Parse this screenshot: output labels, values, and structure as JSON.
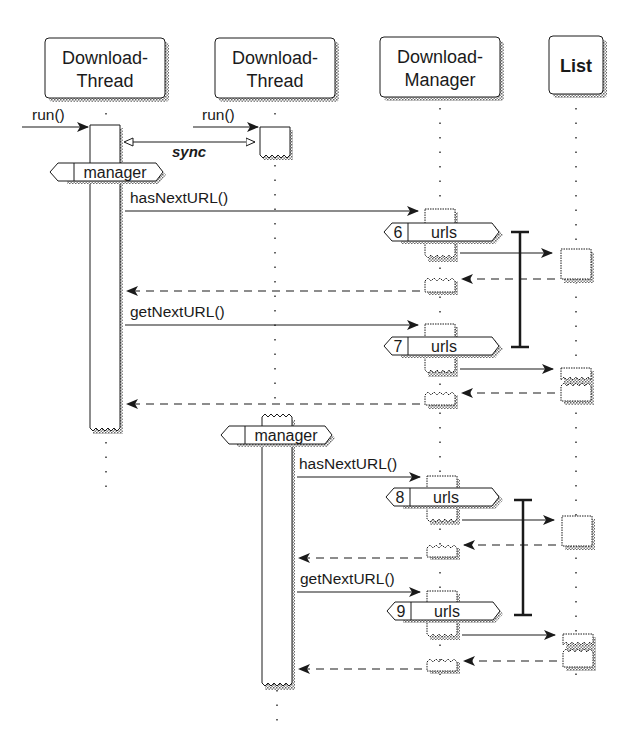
{
  "diagram": {
    "type": "UML sequence diagram",
    "lifelines": [
      {
        "id": "dt1",
        "line1": "Download-",
        "line2": "Thread",
        "x": 104
      },
      {
        "id": "dt2",
        "line1": "Download-",
        "line2": "Thread",
        "x": 275
      },
      {
        "id": "dm",
        "line1": "Download-",
        "line2": "Manager",
        "x": 440
      },
      {
        "id": "list",
        "line1": "List",
        "line2": "",
        "x": 575
      }
    ],
    "messages": {
      "run1": "run()",
      "run2": "run()",
      "sync": "sync",
      "manager1": "manager",
      "manager2": "manager",
      "has1": "hasNextURL()",
      "get1": "getNextURL()",
      "has2": "hasNextURL()",
      "get2": "getNextURL()"
    },
    "access_tags": [
      {
        "num": "6",
        "label": "urls"
      },
      {
        "num": "7",
        "label": "urls"
      },
      {
        "num": "8",
        "label": "urls"
      },
      {
        "num": "9",
        "label": "urls"
      }
    ],
    "colors": {
      "line": "#1a1a1a",
      "shadow": "#8a8a8a",
      "background": "#ffffff"
    }
  }
}
